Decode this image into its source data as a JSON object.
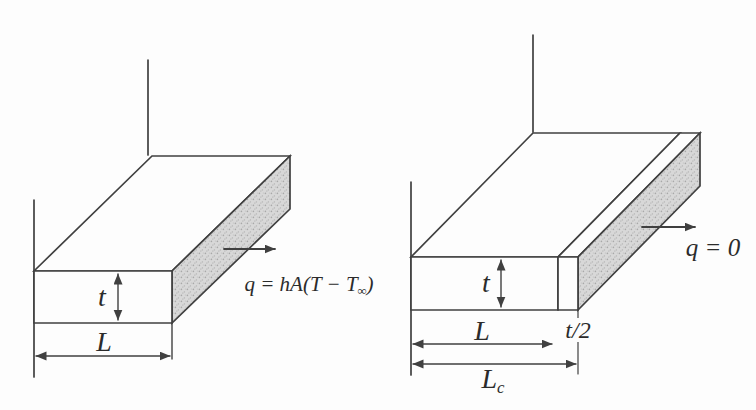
{
  "figure": {
    "colors": {
      "line": "#404040",
      "end_face_shade": "#d8d8d8",
      "background": "#fdfdfd",
      "text": "#2b2b2b"
    },
    "left_fin": {
      "thickness_label": "t",
      "length_label": "L",
      "heat_equation": {
        "main": "q = hA(T − T",
        "subscript": "∞",
        "close": ")"
      }
    },
    "right_fin": {
      "thickness_label": "t",
      "length_label": "L",
      "half_thickness_label": "t/2",
      "corrected_length": {
        "main": "L",
        "subscript": "c"
      },
      "heat_zero_label": "q = 0"
    }
  }
}
